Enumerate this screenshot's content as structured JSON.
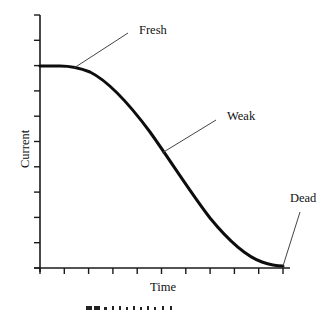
{
  "chart_data": {
    "type": "line",
    "title": "",
    "xlabel": "Time",
    "ylabel": "Current",
    "grid": false,
    "legend": null,
    "x_ticks": 11,
    "y_ticks": 11,
    "x_tick_labels": [],
    "y_tick_labels": [],
    "xlim": [
      0,
      10
    ],
    "ylim": [
      0,
      10
    ],
    "series": [
      {
        "name": "Battery discharge curve",
        "x": [
          0,
          1.0,
          2.0,
          3.0,
          4.0,
          5.0,
          6.0,
          7.0,
          8.0,
          9.0,
          10.0
        ],
        "y": [
          8.0,
          7.95,
          7.3,
          6.1,
          4.7,
          3.2,
          1.9,
          0.95,
          0.35,
          0.08,
          0.0
        ]
      }
    ],
    "annotations": [
      {
        "text": "Fresh",
        "x": 1.4,
        "y": 7.95
      },
      {
        "text": "Weak",
        "x": 5.0,
        "y": 4.5
      },
      {
        "text": "Dead",
        "x": 10.0,
        "y": 0.0
      }
    ],
    "caption_partial": "(cropped caption line, illegible)"
  },
  "labels": {
    "fresh": "Fresh",
    "weak": "Weak",
    "dead": "Dead",
    "xlabel": "Time",
    "ylabel": "Current"
  },
  "colors": {
    "axis": "#1a1a1a",
    "curve": "#0d0d0d",
    "leader": "#444444",
    "text": "#111111"
  }
}
